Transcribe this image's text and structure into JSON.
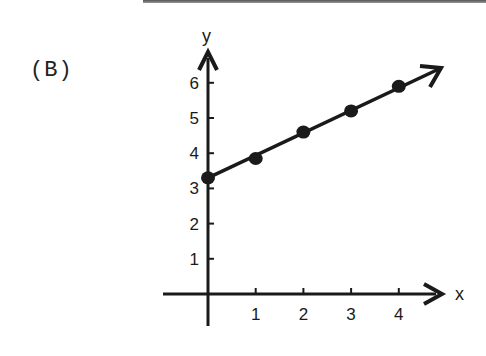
{
  "panel_label": "(B)",
  "chart_data": {
    "type": "line",
    "title": "",
    "xlabel": "x",
    "ylabel": "y",
    "x_ticks": [
      "1",
      "2",
      "3",
      "4"
    ],
    "y_ticks": [
      "1",
      "2",
      "3",
      "4",
      "5",
      "6"
    ],
    "xlim": [
      -1,
      5
    ],
    "ylim": [
      0,
      6.5
    ],
    "grid": false,
    "legend": null,
    "series": [
      {
        "name": "data",
        "x": [
          0,
          1,
          2,
          3,
          4
        ],
        "y": [
          3.3,
          3.85,
          4.6,
          5.2,
          5.9
        ],
        "marker": "filled-circle",
        "line": "straight line with arrowhead extending beyond last point"
      }
    ],
    "annotations": [
      "arrowheads on positive x and y axes",
      "line extends with arrow beyond x=4"
    ]
  },
  "colors": {
    "ink": "#1a1a1a",
    "background": "#ffffff"
  }
}
